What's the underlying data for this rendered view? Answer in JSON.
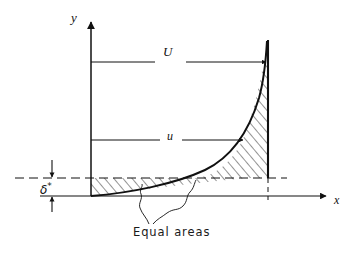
{
  "figure": {
    "kind": "boundary-layer-displacement-thickness-diagram",
    "background_color": "#ffffff",
    "line_color": "#111111",
    "axes": {
      "y_axis_label": "y",
      "x_axis_label": "x",
      "origin": {
        "x": 91,
        "y": 196
      },
      "y_axis_top": {
        "x": 91,
        "y": 18
      },
      "x_axis_right": {
        "x": 330,
        "y": 196
      }
    },
    "annotations": {
      "freestream_velocity_label": "U",
      "local_velocity_label": "u",
      "displacement_thickness_symbol": "δ",
      "displacement_thickness_superscript": "*",
      "equal_areas_label": "Equal areas"
    },
    "geometry": {
      "freestream_line_x": 268,
      "freestream_line_top_y": 40,
      "freestream_line_bottom_y": 196,
      "U_arrow_y": 62,
      "u_arrow_y": 140,
      "displacement_line_y": 178,
      "displacement_line_left_x": 15,
      "displacement_line_right_x": 287,
      "hatch_spacing_px": 7,
      "hatch_angle_deg": 40
    },
    "regions": [
      {
        "name": "left-equal-area",
        "description": "area between wall-level dashed line, y-axis and velocity profile curve"
      },
      {
        "name": "right-equal-area",
        "description": "area between velocity profile curve and free-stream line above displacement line"
      }
    ],
    "curve": {
      "description": "boundary layer velocity profile rising from origin asymptotic to free-stream line",
      "start": {
        "x": 91,
        "y": 196
      },
      "end": {
        "x": 267,
        "y": 40
      }
    }
  }
}
